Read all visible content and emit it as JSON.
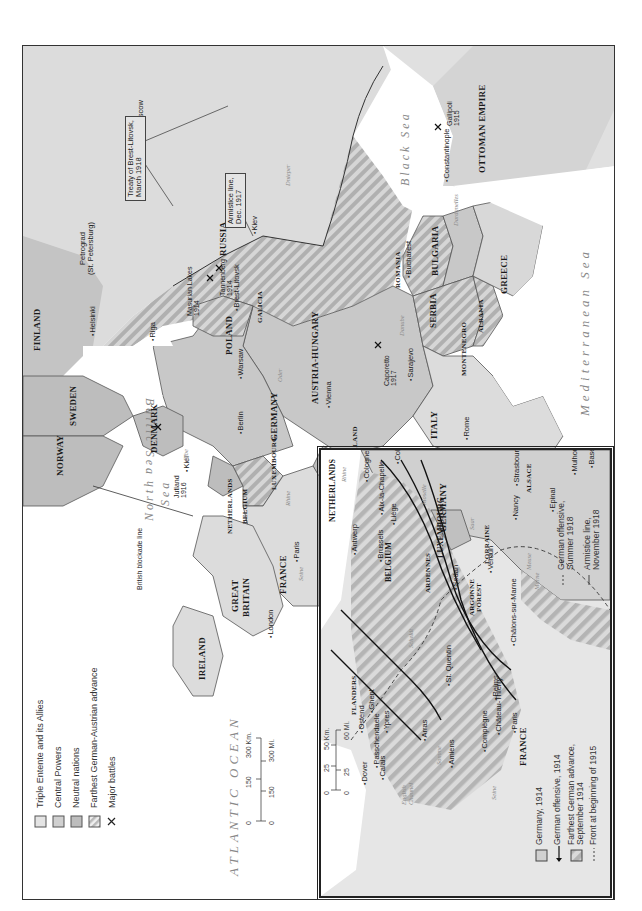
{
  "map": {
    "title": "Europe in World War I",
    "orientation": "rotated-90-ccw",
    "colors": {
      "triple_entente": "#dcdcdc",
      "central_powers": "#c8c8c8",
      "neutral": "#bdbdbd",
      "hatch": "#a8a8a8",
      "water": "#ffffff",
      "border": "#555555"
    }
  },
  "legend": {
    "items": [
      {
        "label": "Triple Entente and its Allies",
        "swatch": "triple-entente"
      },
      {
        "label": "Central Powers",
        "swatch": "central-powers"
      },
      {
        "label": "Neutral nations",
        "swatch": "neutral"
      },
      {
        "label": "Farthest German-Austrian advance",
        "swatch": "hatched"
      },
      {
        "label": "Major battles",
        "swatch": "battle-x"
      }
    ]
  },
  "scale": {
    "km_ticks": [
      "0",
      "150",
      "300 Km."
    ],
    "mi_ticks": [
      "0",
      "150",
      "300 Mi."
    ]
  },
  "seas": {
    "atlantic": "ATLANTIC OCEAN",
    "north_sea_1": "North",
    "north_sea_2": "Sea",
    "baltic": "Baltic Sea",
    "black": "Black Sea",
    "mediterranean": "Mediterranean Sea"
  },
  "countries": {
    "norway": "NORWAY",
    "sweden": "SWEDEN",
    "finland": "FINLAND",
    "russia": "RUSSIA",
    "denmark": "DENMARK",
    "great_britain_1": "GREAT",
    "great_britain_2": "BRITAIN",
    "ireland": "IRELAND",
    "netherlands": "NETHERLANDS",
    "belgium": "BELGIUM",
    "luxembourg": "LUXEMBOURG",
    "france": "FRANCE",
    "germany": "GERMANY",
    "poland": "POLAND",
    "galicia": "GALICIA",
    "austria_hungary": "AUSTRIA-HUNGARY",
    "switzerland": "SWITZERLAND",
    "italy": "ITALY",
    "romania": "ROMANIA",
    "bulgaria": "BULGARIA",
    "serbia": "SERBIA",
    "montenegro": "MONTENEGRO",
    "albania": "ALBANIA",
    "greece": "GREECE",
    "ottoman": "OTTOMAN EMPIRE"
  },
  "cities": {
    "moscow": "Moscow",
    "petrograd_1": "Petrograd",
    "petrograd_2": "(St. Petersburg)",
    "helsinki": "Helsinki",
    "riga": "Riga",
    "kiev": "Kiev",
    "brest_litovsk": "Brest-Litovsk",
    "warsaw": "Warsaw",
    "berlin": "Berlin",
    "kiel": "Kiel",
    "vienna": "Vienna",
    "bucharest": "Bucharest",
    "constantinople": "Constantinople",
    "sarajevo": "Sarajevo",
    "rome": "Rome",
    "london": "London",
    "paris": "Paris"
  },
  "rivers": {
    "dnieper": "Dnieper",
    "danube": "Danube",
    "oder": "Oder",
    "elbe": "Elbe",
    "rhine": "Rhine",
    "seine": "Seine",
    "dardanelles": "Dardanelles",
    "vistula": "Vistula"
  },
  "battles": [
    {
      "name": "Jutland\n1916"
    },
    {
      "name": "Masurian Lakes\n1914"
    },
    {
      "name": "Tannenberg\n1914"
    },
    {
      "name": "Caporetto\n1917"
    },
    {
      "name": "Gallipoli\n1915"
    }
  ],
  "callouts": {
    "brest_treaty": "Treaty of Brest-Litovsk,\nMarch 1918",
    "armistice_1917": "Armistice line,\nDec. 1917",
    "blockade": "British blockade line"
  },
  "inset": {
    "countries": {
      "netherlands": "NETHERLANDS",
      "belgium": "BELGIUM",
      "luxembourg": "LUXEMBOURG",
      "germany": "GERMANY",
      "france": "FRANCE",
      "flanders": "FLANDERS",
      "ardennes": "ARDENNES",
      "argonne_1": "ARGONNE",
      "argonne_2": "FOREST",
      "lorraine": "LORRAINE",
      "alsace": "ALSACE"
    },
    "cities": {
      "antwerp": "Antwerp",
      "brussels": "Brussels",
      "liege": "Liège",
      "aix": "Aix-la-Chapelle",
      "cologne": "Cologne",
      "coblenz": "Coblenz",
      "sedan": "Sedan",
      "verdun": "Verdun",
      "nancy": "Nancy",
      "strasbourg": "Strasbourg",
      "epinal": "Epinal",
      "mulhouse": "Mulhouse",
      "basel": "Basel",
      "chalons": "Châlons-sur-Marne",
      "reims": "Reims",
      "st_quentin": "St. Quentin",
      "chateau_thierry": "Château-Thierry",
      "compiegne": "Compiègne",
      "paris": "Paris",
      "amiens": "Amiens",
      "arras": "Arras",
      "ypres": "Ypres",
      "passchendaele": "Passchendaele",
      "ghent": "Ghent",
      "ostend": "Ostend",
      "calais": "Calais",
      "dover": "Dover"
    },
    "rivers": {
      "rhine": "Rhine",
      "meuse": "Meuse",
      "marne": "Marne",
      "somme": "Somme",
      "seine": "Seine",
      "moselle": "Moselle",
      "saar": "Saar",
      "scheldt": "Scheldt",
      "english_channel_1": "English",
      "english_channel_2": "Channel"
    },
    "scale": {
      "km_ticks": [
        "0",
        "25",
        "50 Km."
      ],
      "mi_ticks": [
        "0",
        "25",
        "60 Mi."
      ]
    },
    "legend": {
      "germany_1914": "Germany, 1914",
      "german_offensive_1914": "German offensive, 1914",
      "farthest_advance": "Farthest German advance,\nSeptember 1914",
      "front_1915": "Front at beginning of 1915",
      "german_offensive_1918": "German offensive,\nSummer 1918",
      "armistice_1918": "Armistice line,\nNovember 1918"
    }
  }
}
